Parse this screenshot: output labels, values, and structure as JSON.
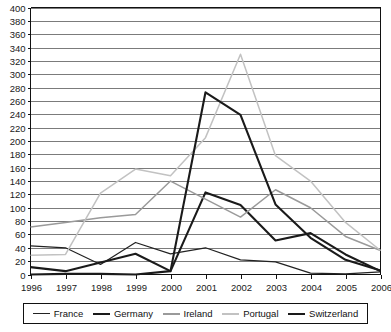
{
  "chart_data": {
    "type": "line",
    "title": "",
    "xlabel": "",
    "ylabel": "",
    "categories": [
      "1996",
      "1997",
      "1998",
      "1999",
      "2000",
      "2001",
      "2002",
      "2003",
      "2004",
      "2005",
      "2006"
    ],
    "ylim": [
      0,
      400
    ],
    "ytick_step": 20,
    "yticks": [
      "400",
      "380",
      "360",
      "340",
      "320",
      "300",
      "280",
      "260",
      "240",
      "220",
      "200",
      "180",
      "160",
      "140",
      "120",
      "100",
      "80",
      "60",
      "40",
      "20",
      "0"
    ],
    "grid": true,
    "legend_position": "bottom",
    "series": [
      {
        "name": "France",
        "color": "#222222",
        "width": 1.2,
        "values": [
          43,
          40,
          15,
          48,
          31,
          40,
          22,
          19,
          2,
          1,
          4
        ]
      },
      {
        "name": "Germany",
        "color": "#1a1a1a",
        "width": 2.1,
        "values": [
          11,
          5,
          18,
          31,
          5,
          123,
          104,
          51,
          62,
          30,
          5
        ]
      },
      {
        "name": "Ireland",
        "color": "#9a9a9a",
        "width": 1.5,
        "values": [
          71,
          78,
          85,
          90,
          140,
          113,
          86,
          127,
          100,
          57,
          36
        ]
      },
      {
        "name": "Portugal",
        "color": "#c2c2c2",
        "width": 1.5,
        "values": [
          29,
          30,
          122,
          158,
          148,
          205,
          330,
          178,
          140,
          78,
          36
        ]
      },
      {
        "name": "Switzerland",
        "color": "#1a1a1a",
        "width": 2.1,
        "values": [
          0,
          1,
          1,
          0,
          5,
          273,
          239,
          105,
          55,
          22,
          6
        ]
      }
    ]
  },
  "legend": {
    "items": [
      {
        "label": "France"
      },
      {
        "label": "Germany"
      },
      {
        "label": "Ireland"
      },
      {
        "label": "Portugal"
      },
      {
        "label": "Switzerland"
      }
    ]
  }
}
